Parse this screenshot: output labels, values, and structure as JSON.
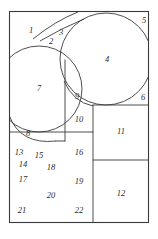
{
  "figure": {
    "canvas": {
      "width": 158,
      "height": 239,
      "background": "#ffffff"
    },
    "frame": {
      "x": 9,
      "y": 11,
      "width": 140,
      "height": 212,
      "stroke": "#3a3a3a"
    },
    "stroke_color": "#3a3a3a",
    "label_color": "#2b2b2b",
    "region_count": 22,
    "regions": [
      {
        "id": 1,
        "label": "1",
        "x": 31,
        "y": 31,
        "shape": "arc-bounded-area"
      },
      {
        "id": 2,
        "label": "2",
        "x": 51,
        "y": 42,
        "shape": "lune"
      },
      {
        "id": 3,
        "label": "3",
        "x": 61,
        "y": 33,
        "shape": "lune"
      },
      {
        "id": 4,
        "label": "4",
        "x": 107,
        "y": 60,
        "shape": "circle-interior"
      },
      {
        "id": 5,
        "label": "5",
        "x": 144,
        "y": 21,
        "shape": "corner-sliver"
      },
      {
        "id": 6,
        "label": "6",
        "x": 143,
        "y": 98,
        "shape": "corner-sliver"
      },
      {
        "id": 7,
        "label": "7",
        "x": 39,
        "y": 89,
        "shape": "circle-segment"
      },
      {
        "id": 8,
        "label": "8",
        "x": 28,
        "y": 134,
        "shape": "lune"
      },
      {
        "id": 9,
        "label": "9",
        "x": 77,
        "y": 97,
        "shape": "lune"
      },
      {
        "id": 10,
        "label": "10",
        "x": 79,
        "y": 120,
        "shape": "rectangular"
      },
      {
        "id": 11,
        "label": "11",
        "x": 121,
        "y": 132,
        "shape": "rectangle"
      },
      {
        "id": 12,
        "label": "12",
        "x": 121,
        "y": 194,
        "shape": "rectangle"
      },
      {
        "id": 13,
        "label": "13",
        "x": 19,
        "y": 153,
        "shape": "polygon-area"
      },
      {
        "id": 14,
        "label": "14",
        "x": 23,
        "y": 165,
        "shape": "polygon-area"
      },
      {
        "id": 15,
        "label": "15",
        "x": 39,
        "y": 156,
        "shape": "polygon-area"
      },
      {
        "id": 16,
        "label": "16",
        "x": 79,
        "y": 153,
        "shape": "polygon-area"
      },
      {
        "id": 17,
        "label": "17",
        "x": 23,
        "y": 180,
        "shape": "polygon-area"
      },
      {
        "id": 18,
        "label": "18",
        "x": 51,
        "y": 168,
        "shape": "polygon-area"
      },
      {
        "id": 19,
        "label": "19",
        "x": 79,
        "y": 182,
        "shape": "polygon-area"
      },
      {
        "id": 20,
        "label": "20",
        "x": 51,
        "y": 196,
        "shape": "polygon-area"
      },
      {
        "id": 21,
        "label": "21",
        "x": 22,
        "y": 211,
        "shape": "polygon-area"
      },
      {
        "id": 22,
        "label": "22",
        "x": 79,
        "y": 211,
        "shape": "polygon-area"
      }
    ],
    "circles": [
      {
        "name": "upper-right-circle",
        "cx": 106,
        "cy": 59,
        "r": 46
      },
      {
        "name": "left-circle",
        "cx": 39,
        "cy": 89,
        "r": 43
      }
    ],
    "arcs": [
      {
        "name": "upper-left-crescent-arc",
        "d": "M 34 38 Q 57 19 86 11"
      },
      {
        "name": "inner-crescent-arc",
        "d": "M 39 42 Q 62 27 86 17"
      },
      {
        "name": "lower-left-crescent-arc",
        "d": "M 9 118 Q 22 146 57 141"
      },
      {
        "name": "region-nine-arc",
        "d": "M 65 83 Q 75 103 94 105"
      }
    ],
    "lines": [
      {
        "name": "vertical-divider-mid",
        "x1": 65,
        "y1": 63,
        "x2": 65,
        "y2": 132
      },
      {
        "name": "horizontal-divider-131",
        "x1": 9,
        "y1": 132,
        "x2": 94,
        "y2": 132
      },
      {
        "name": "vertical-divider-right",
        "x1": 93,
        "y1": 105,
        "x2": 93,
        "y2": 223
      },
      {
        "name": "horizontal-divider-105",
        "x1": 93,
        "y1": 105,
        "x2": 149,
        "y2": 105
      },
      {
        "name": "horizontal-divider-160",
        "x1": 93,
        "y1": 160,
        "x2": 149,
        "y2": 160
      },
      {
        "name": "vertical-divider-lower",
        "x1": 65,
        "y1": 132,
        "x2": 65,
        "y2": 141
      }
    ]
  }
}
